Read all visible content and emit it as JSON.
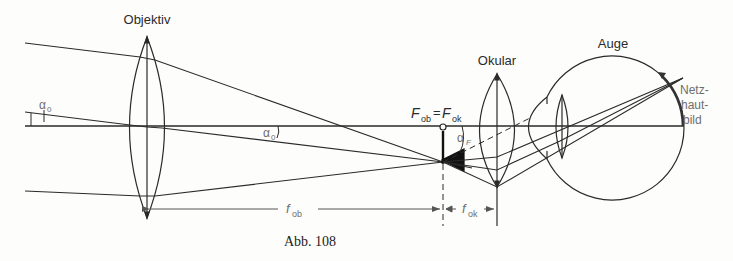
{
  "figure": {
    "caption": "Abb. 108"
  },
  "labels": {
    "objective": "Objektiv",
    "ocular": "Okular",
    "eye": "Auge",
    "retina_line1": "Netz-",
    "retina_line2": "haut-",
    "retina_line3": "bild",
    "focal_eq_F1": "F",
    "focal_eq_sub1": "ob",
    "focal_eq_eq": "=",
    "focal_eq_F2": "F",
    "focal_eq_sub2": "ok",
    "alpha0_left": "α",
    "alpha0_left_sub": "0",
    "alpha0_mid": "α",
    "alpha0_mid_sub": "0",
    "alphaF": "α",
    "alphaF_sub": "F",
    "f_ob": "f",
    "f_ob_sub": "ob",
    "f_ok": "f",
    "f_ok_sub": "ok"
  },
  "colors": {
    "line": "#2a2a2a",
    "label": "#2b2b2b",
    "muted": "#6e6e6e",
    "background": "#fdfdfb"
  }
}
